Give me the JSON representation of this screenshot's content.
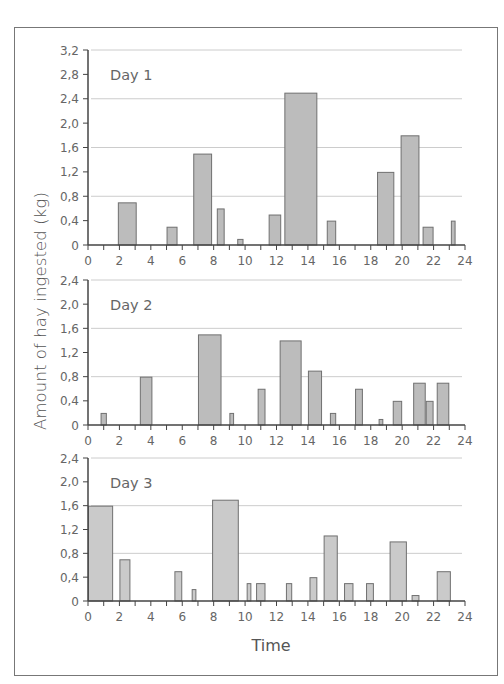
{
  "figure": {
    "y_axis_title": "Amount of hay ingested (kg)",
    "x_axis_title": "Time",
    "colors": {
      "bar_fill": "#bcbcbc",
      "bar_fill_day3": "#cacaca",
      "bar_stroke": "#707070",
      "grid": "#cccccc",
      "axis": "#444444",
      "frame": "#777777"
    }
  },
  "chart_data": [
    {
      "type": "bar",
      "title": "Day 1",
      "xlabel": "Time",
      "ylabel": "Amount of hay ingested (kg)",
      "xlim": [
        0,
        24
      ],
      "ylim": [
        0,
        3.2
      ],
      "x_ticks": [
        "0",
        "2",
        "4",
        "6",
        "8",
        "10",
        "12",
        "14",
        "16",
        "18",
        "20",
        "22",
        "24"
      ],
      "y_ticks": [
        "0",
        "0,4",
        "0,8",
        "1,2",
        "1,6",
        "2,0",
        "2,4",
        "2,8",
        "3,2"
      ],
      "grid": true,
      "bars": [
        {
          "start": 1.9,
          "end": 3.1,
          "value": 0.7
        },
        {
          "start": 5.0,
          "end": 5.7,
          "value": 0.3
        },
        {
          "start": 6.7,
          "end": 7.9,
          "value": 1.5
        },
        {
          "start": 8.2,
          "end": 8.7,
          "value": 0.6
        },
        {
          "start": 9.5,
          "end": 9.9,
          "value": 0.1
        },
        {
          "start": 11.5,
          "end": 12.3,
          "value": 0.5
        },
        {
          "start": 12.5,
          "end": 14.6,
          "value": 2.5
        },
        {
          "start": 15.2,
          "end": 15.8,
          "value": 0.4
        },
        {
          "start": 18.4,
          "end": 19.5,
          "value": 1.2
        },
        {
          "start": 19.9,
          "end": 21.1,
          "value": 1.8
        },
        {
          "start": 21.3,
          "end": 22.0,
          "value": 0.3
        },
        {
          "start": 23.1,
          "end": 23.4,
          "value": 0.4
        }
      ]
    },
    {
      "type": "bar",
      "title": "Day 2",
      "xlabel": "Time",
      "ylabel": "Amount of hay ingested (kg)",
      "xlim": [
        0,
        24
      ],
      "ylim": [
        0,
        2.4
      ],
      "x_ticks": [
        "0",
        "2",
        "4",
        "6",
        "8",
        "10",
        "12",
        "14",
        "16",
        "18",
        "20",
        "22",
        "24"
      ],
      "y_ticks": [
        "0",
        "0,4",
        "0,8",
        "1,2",
        "1,6",
        "2,0",
        "2,4"
      ],
      "grid": true,
      "bars": [
        {
          "start": 0.8,
          "end": 1.2,
          "value": 0.2
        },
        {
          "start": 3.3,
          "end": 4.1,
          "value": 0.8
        },
        {
          "start": 7.0,
          "end": 8.5,
          "value": 1.5
        },
        {
          "start": 9.0,
          "end": 9.3,
          "value": 0.2
        },
        {
          "start": 10.8,
          "end": 11.3,
          "value": 0.6
        },
        {
          "start": 12.2,
          "end": 13.6,
          "value": 1.4
        },
        {
          "start": 14.0,
          "end": 14.9,
          "value": 0.9
        },
        {
          "start": 15.4,
          "end": 15.8,
          "value": 0.2
        },
        {
          "start": 17.0,
          "end": 17.5,
          "value": 0.6
        },
        {
          "start": 18.5,
          "end": 18.8,
          "value": 0.1
        },
        {
          "start": 19.4,
          "end": 20.0,
          "value": 0.4
        },
        {
          "start": 20.7,
          "end": 21.5,
          "value": 0.7
        },
        {
          "start": 21.5,
          "end": 22.0,
          "value": 0.4
        },
        {
          "start": 22.2,
          "end": 23.0,
          "value": 0.7
        }
      ]
    },
    {
      "type": "bar",
      "title": "Day 3",
      "xlabel": "Time",
      "ylabel": "Amount of hay ingested (kg)",
      "xlim": [
        0,
        24
      ],
      "ylim": [
        0,
        2.4
      ],
      "x_ticks": [
        "0",
        "2",
        "4",
        "6",
        "8",
        "10",
        "12",
        "14",
        "16",
        "18",
        "20",
        "22",
        "24"
      ],
      "y_ticks": [
        "0",
        "0,4",
        "0,8",
        "1,2",
        "1,6",
        "2,0",
        "2,4"
      ],
      "grid": true,
      "bars": [
        {
          "start": 0.0,
          "end": 1.6,
          "value": 1.6
        },
        {
          "start": 2.0,
          "end": 2.7,
          "value": 0.7
        },
        {
          "start": 5.5,
          "end": 6.0,
          "value": 0.5
        },
        {
          "start": 6.6,
          "end": 6.9,
          "value": 0.2
        },
        {
          "start": 7.9,
          "end": 9.6,
          "value": 1.7
        },
        {
          "start": 10.1,
          "end": 10.4,
          "value": 0.3
        },
        {
          "start": 10.7,
          "end": 11.3,
          "value": 0.3
        },
        {
          "start": 12.6,
          "end": 13.0,
          "value": 0.3
        },
        {
          "start": 14.1,
          "end": 14.6,
          "value": 0.4
        },
        {
          "start": 15.0,
          "end": 15.9,
          "value": 1.1
        },
        {
          "start": 16.3,
          "end": 16.9,
          "value": 0.3
        },
        {
          "start": 17.7,
          "end": 18.2,
          "value": 0.3
        },
        {
          "start": 19.2,
          "end": 20.3,
          "value": 1.0
        },
        {
          "start": 20.6,
          "end": 21.1,
          "value": 0.1
        },
        {
          "start": 22.2,
          "end": 23.1,
          "value": 0.5
        }
      ]
    }
  ]
}
